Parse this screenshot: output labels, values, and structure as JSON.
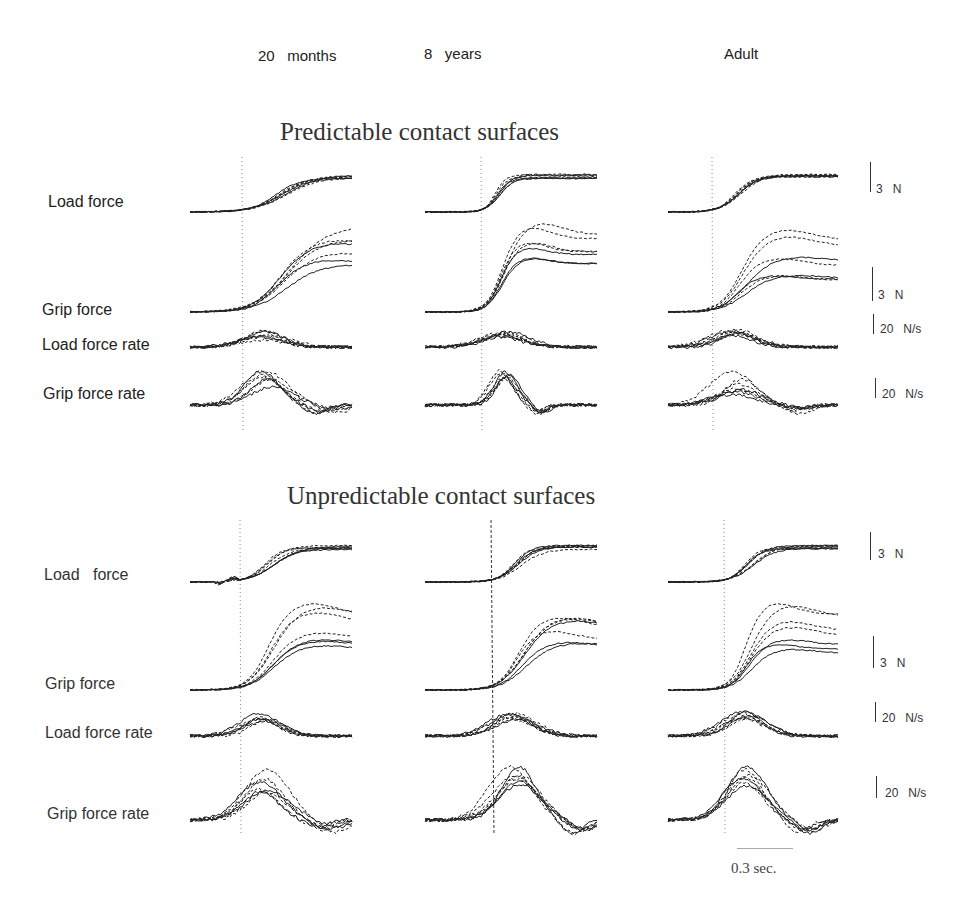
{
  "columns": [
    {
      "label": "20   months",
      "x": 258
    },
    {
      "label": "8   years",
      "x": 497
    },
    {
      "label": "Adult",
      "x": 723
    }
  ],
  "sections": [
    {
      "title": "Predictable contact surfaces",
      "row_labels": [
        "Load force",
        "Grip force",
        "Load force rate",
        "Grip force rate"
      ],
      "scales": [
        "3   N",
        "3   N",
        "20   N/s",
        "20   N/s"
      ]
    },
    {
      "title": "Unpredictable contact surfaces",
      "row_labels": [
        "Load   force",
        "Grip force",
        "Load force rate",
        "Grip force rate"
      ],
      "scales": [
        "3   N",
        "3   N",
        "20   N/s",
        "20   N/s"
      ]
    }
  ],
  "time_scale": "0.3 sec.",
  "colors": {
    "trace": "#222222",
    "text": "#222222",
    "onset_line": "#666666",
    "background": "#ffffff"
  },
  "chart_data": {
    "type": "line",
    "legend": {
      "solid": "trials of one surface condition",
      "dashed": "trials of other surface condition"
    },
    "xlabel": "time (scale bar 0.3 sec.)",
    "columns": [
      "20 months",
      "8 years",
      "Adult"
    ],
    "rows": [
      "Load force",
      "Grip force",
      "Load force rate",
      "Grip force rate"
    ],
    "scale_bars": {
      "Load force": "3 N",
      "Grip force": "3 N",
      "Load force rate": "20 N/s",
      "Grip force rate": "20 N/s"
    },
    "panels": [
      {
        "section": "Predictable contact surfaces",
        "column": "20 months",
        "load_force": {
          "baseline": 0,
          "plateau": [
            2.6,
            3.0
          ],
          "rise_time_s": 0.45
        },
        "grip_force": {
          "baseline": 0,
          "peak_range": [
            3.0,
            5.5
          ],
          "rise_time_s": 0.5
        },
        "load_force_rate": {
          "peak_range": [
            5,
            12
          ]
        },
        "grip_force_rate": {
          "peak_range": [
            8,
            20
          ]
        }
      },
      {
        "section": "Predictable contact surfaces",
        "column": "8 years",
        "load_force": {
          "baseline": 0,
          "plateau": [
            2.8,
            3.1
          ],
          "rise_time_s": 0.2
        },
        "grip_force": {
          "baseline": 0,
          "peak_range": [
            3.8,
            5.8
          ],
          "rise_time_s": 0.25
        },
        "load_force_rate": {
          "peak_range": [
            8,
            14
          ]
        },
        "grip_force_rate": {
          "peak_range": [
            25,
            35
          ]
        }
      },
      {
        "section": "Predictable contact surfaces",
        "column": "Adult",
        "load_force": {
          "baseline": 0,
          "plateau": [
            3.0,
            3.1
          ],
          "rise_time_s": 0.3
        },
        "grip_force": {
          "baseline": 0,
          "peak_range": [
            2.6,
            7.0
          ],
          "rise_time_s": 0.35
        },
        "load_force_rate": {
          "peak_range": [
            6,
            12
          ]
        },
        "grip_force_rate": {
          "peak_range": [
            8,
            30
          ]
        }
      },
      {
        "section": "Unpredictable contact surfaces",
        "column": "20 months",
        "load_force": {
          "baseline": 0,
          "plateau": [
            2.6,
            3.0
          ],
          "rise_time_s": 0.35
        },
        "grip_force": {
          "baseline": 0,
          "peak_range": [
            3.5,
            6.0
          ],
          "rise_time_s": 0.35
        },
        "load_force_rate": {
          "peak_range": [
            8,
            14
          ]
        },
        "grip_force_rate": {
          "peak_range": [
            15,
            35
          ]
        }
      },
      {
        "section": "Unpredictable contact surfaces",
        "column": "8 years",
        "load_force": {
          "baseline": 0,
          "plateau": [
            2.8,
            3.1
          ],
          "rise_time_s": 0.3
        },
        "grip_force": {
          "baseline": 0,
          "peak_range": [
            3.0,
            4.8
          ],
          "rise_time_s": 0.35
        },
        "load_force_rate": {
          "peak_range": [
            10,
            16
          ]
        },
        "grip_force_rate": {
          "peak_range": [
            12,
            20
          ]
        }
      },
      {
        "section": "Unpredictable contact surfaces",
        "column": "Adult",
        "load_force": {
          "baseline": 0,
          "plateau": [
            3.0,
            3.2
          ],
          "rise_time_s": 0.3
        },
        "grip_force": {
          "baseline": 0,
          "peak_range": [
            4.0,
            8.0
          ],
          "rise_time_s": 0.3
        },
        "load_force_rate": {
          "peak_range": [
            8,
            12
          ]
        },
        "grip_force_rate": {
          "peak_range": [
            18,
            32
          ]
        }
      }
    ]
  }
}
